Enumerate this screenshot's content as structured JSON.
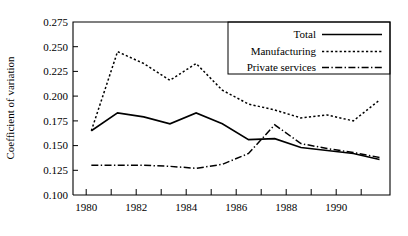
{
  "chart_data": {
    "type": "line",
    "title": "",
    "xlabel": "",
    "ylabel": "Coefficient of variation",
    "xlim": [
      1979.3,
      1991.4
    ],
    "ylim": [
      0.1,
      0.275
    ],
    "grid": false,
    "legend_position": "top-right",
    "x": [
      1980,
      1981,
      1982,
      1983,
      1984,
      1985,
      1986,
      1987,
      1988,
      1989,
      1990,
      1991
    ],
    "ytick_labels": [
      "0.100",
      "0.125",
      "0.150",
      "0.175",
      "0.200",
      "0.225",
      "0.250",
      "0.275"
    ],
    "ytick_values": [
      0.1,
      0.125,
      0.15,
      0.175,
      0.2,
      0.225,
      0.25,
      0.275
    ],
    "xtick_values": [
      1980,
      1981,
      1982,
      1983,
      1984,
      1985,
      1986,
      1987,
      1988,
      1989,
      1990,
      1991
    ],
    "xtick_labels": [
      "1980",
      "",
      "1982",
      "",
      "1984",
      "",
      "1986",
      "",
      "1988",
      "",
      "1990",
      ""
    ],
    "series": [
      {
        "name": "Total",
        "style": "solid",
        "values": [
          0.165,
          0.183,
          0.179,
          0.172,
          0.183,
          0.172,
          0.156,
          0.157,
          0.148,
          0.145,
          0.142,
          0.136
        ]
      },
      {
        "name": "Manufacturing",
        "style": "dotted",
        "values": [
          0.165,
          0.245,
          0.233,
          0.216,
          0.233,
          0.206,
          0.192,
          0.186,
          0.178,
          0.181,
          0.175,
          0.196
        ]
      },
      {
        "name": "Private services",
        "style": "dash-dot",
        "values": [
          0.13,
          0.13,
          0.13,
          0.129,
          0.127,
          0.131,
          0.142,
          0.171,
          0.152,
          0.147,
          0.143,
          0.138
        ]
      }
    ]
  },
  "legend": {
    "entries": [
      {
        "label": "Total",
        "style": "solid"
      },
      {
        "label": "Manufacturing",
        "style": "dotted"
      },
      {
        "label": "Private services",
        "style": "dash-dot"
      }
    ]
  }
}
